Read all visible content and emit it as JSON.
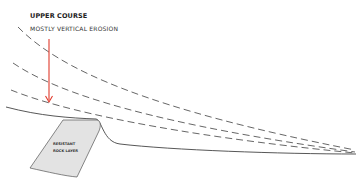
{
  "diagram": {
    "title": "UPPER COURSE",
    "subtitle": "MOSTLY VERTICAL EROSION",
    "rock_label_line1": "RESISTANT",
    "rock_label_line2": "ROCK LAYER",
    "colors": {
      "arrow": "#e0392b",
      "line": "#444444",
      "rock_fill": "#e3e3e3"
    }
  }
}
